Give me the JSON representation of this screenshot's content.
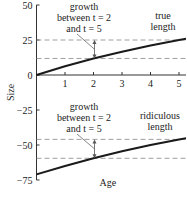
{
  "chart_data": {
    "type": "line",
    "title": "",
    "xlabel": "Age",
    "ylabel": "Size",
    "xlim": [
      0,
      5.5
    ],
    "ylim": [
      -75,
      50
    ],
    "x_ticks": [
      1,
      2,
      3,
      4,
      5
    ],
    "x_tick_labels": [
      "1",
      "2",
      "3",
      "4",
      "5"
    ],
    "y_ticks": [
      50,
      25,
      0,
      -25,
      -50,
      -75
    ],
    "y_tick_labels": [
      "50",
      "25",
      "0",
      "−25",
      "−50",
      "−75"
    ],
    "grid": false,
    "series": [
      {
        "name": "true length",
        "label_lines": [
          "true",
          "length"
        ],
        "x": [
          0,
          1,
          2,
          3,
          4,
          5,
          5.5
        ],
        "y": [
          0,
          6.2,
          11.8,
          16.6,
          21,
          25,
          26.8
        ]
      },
      {
        "name": "ridiculous length",
        "label_lines": [
          "ridiculous",
          "length"
        ],
        "x": [
          0,
          1,
          2,
          3,
          4,
          5,
          5.5
        ],
        "y": [
          -71,
          -65,
          -59.5,
          -54.5,
          -50,
          -46,
          -44.2
        ]
      }
    ],
    "annotations": [
      {
        "text_lines": [
          "growth",
          "between t = 2",
          "and t = 5"
        ],
        "series": "true length",
        "from_x": 2,
        "to_x": 5,
        "low_y": 11.8,
        "high_y": 25
      },
      {
        "text_lines": [
          "growth",
          "between t = 2",
          "and t = 5"
        ],
        "series": "ridiculous length",
        "from_x": 2,
        "to_x": 5,
        "low_y": -59.5,
        "high_y": -46
      }
    ]
  }
}
